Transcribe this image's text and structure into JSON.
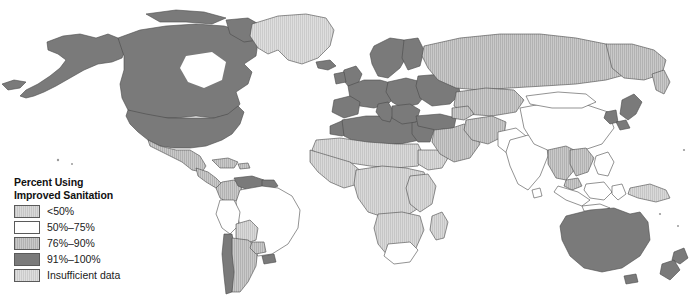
{
  "figure": {
    "type": "choropleth-world-map",
    "background_color": "#ffffff"
  },
  "legend": {
    "title_line1": "Percent Using",
    "title_line2": "Improved Sanitation",
    "items": [
      {
        "label": "<50%",
        "color": "#cfcfcf",
        "pattern": "vertical-hatch"
      },
      {
        "label": "50%–75%",
        "color": "#ffffff",
        "pattern": "solid"
      },
      {
        "label": "76%–90%",
        "color": "#bdbdbd",
        "pattern": "vertical-hatch"
      },
      {
        "label": "91%–100%",
        "color": "#7a7a7a",
        "pattern": "solid"
      },
      {
        "label": "Insufficient data",
        "color": "#d7d7d7",
        "pattern": "vertical-hatch"
      }
    ]
  },
  "map": {
    "outline_color": "#4a4a4a",
    "regions": [
      {
        "name": "Canada",
        "category": "91%–100%"
      },
      {
        "name": "United States",
        "category": "91%–100%"
      },
      {
        "name": "Alaska",
        "category": "91%–100%"
      },
      {
        "name": "Greenland",
        "category": "Insufficient data"
      },
      {
        "name": "Mexico",
        "category": "76%–90%"
      },
      {
        "name": "Central America",
        "category": "76%–90%"
      },
      {
        "name": "Caribbean",
        "category": "76%–90%"
      },
      {
        "name": "Colombia",
        "category": "76%–90%"
      },
      {
        "name": "Venezuela",
        "category": "91%–100%"
      },
      {
        "name": "Brazil",
        "category": "50%–75%"
      },
      {
        "name": "Peru",
        "category": "50%–75%"
      },
      {
        "name": "Bolivia",
        "category": "<50%"
      },
      {
        "name": "Paraguay",
        "category": "76%–90%"
      },
      {
        "name": "Argentina",
        "category": "76%–90%"
      },
      {
        "name": "Chile",
        "category": "91%–100%"
      },
      {
        "name": "Uruguay",
        "category": "91%–100%"
      },
      {
        "name": "North Africa",
        "category": "91%–100%"
      },
      {
        "name": "Sub-Saharan Africa",
        "category": "<50%"
      },
      {
        "name": "South Africa",
        "category": "50%–75%"
      },
      {
        "name": "Madagascar",
        "category": "<50%"
      },
      {
        "name": "Western Europe",
        "category": "91%–100%"
      },
      {
        "name": "Northern Europe",
        "category": "91%–100%"
      },
      {
        "name": "Eastern Europe",
        "category": "91%–100%"
      },
      {
        "name": "Turkey",
        "category": "91%–100%"
      },
      {
        "name": "Middle East",
        "category": "76%–90%"
      },
      {
        "name": "Russia",
        "category": "76%–90%"
      },
      {
        "name": "Central Asia",
        "category": "76%–90%"
      },
      {
        "name": "China",
        "category": "50%–75%"
      },
      {
        "name": "Mongolia",
        "category": "50%–75%"
      },
      {
        "name": "India",
        "category": "<50%"
      },
      {
        "name": "Pakistan",
        "category": "50%–75%"
      },
      {
        "name": "Southeast Asia",
        "category": "76%–90%"
      },
      {
        "name": "Indonesia",
        "category": "50%–75%"
      },
      {
        "name": "Japan",
        "category": "91%–100%"
      },
      {
        "name": "Korea",
        "category": "91%–100%"
      },
      {
        "name": "Papua New Guinea",
        "category": "<50%"
      },
      {
        "name": "Australia",
        "category": "91%–100%"
      },
      {
        "name": "New Zealand",
        "category": "91%–100%"
      }
    ]
  }
}
